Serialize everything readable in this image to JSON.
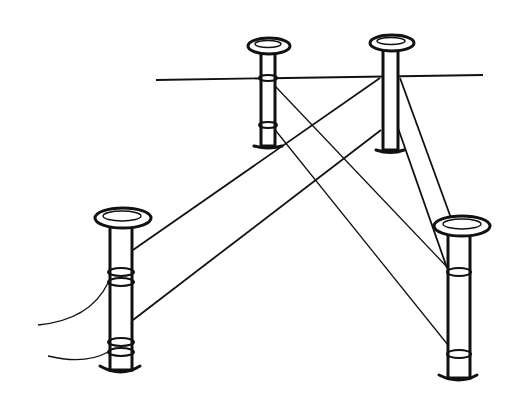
{
  "figure": {
    "posts": [
      {
        "id": "rear-left",
        "x": 267,
        "top": 45
      },
      {
        "id": "rear-right",
        "x": 391,
        "top": 42
      },
      {
        "id": "front-left",
        "x": 122,
        "top": 216
      },
      {
        "id": "front-right",
        "x": 460,
        "top": 222
      }
    ],
    "ink_color": "#111111",
    "background": "#ffffff"
  }
}
